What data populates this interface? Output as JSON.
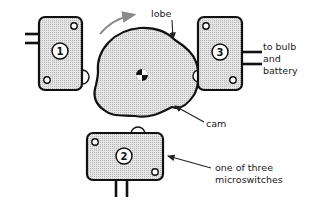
{
  "figure": {
    "colors": {
      "outline": "#111111",
      "fill_pattern": "#c8c8c8",
      "rotation_arrow": "#8a8a8a",
      "background": "#ffffff"
    }
  },
  "switches": [
    {
      "id": "switch-1",
      "number": "1",
      "terminals": "left",
      "plunger": "right"
    },
    {
      "id": "switch-2",
      "number": "2",
      "terminals": "bottom",
      "plunger": "top"
    },
    {
      "id": "switch-3",
      "number": "3",
      "terminals": "right",
      "plunger": "left"
    }
  ],
  "labels": {
    "lobe": "lobe",
    "cam": "cam",
    "to_bulb_line1": "to bulb",
    "to_bulb_line2": "and",
    "to_bulb_line3": "battery",
    "microswitch_line1": "one of three",
    "microswitch_line2": "microswitches"
  },
  "annotations": {
    "rotation_direction": "clockwise"
  }
}
